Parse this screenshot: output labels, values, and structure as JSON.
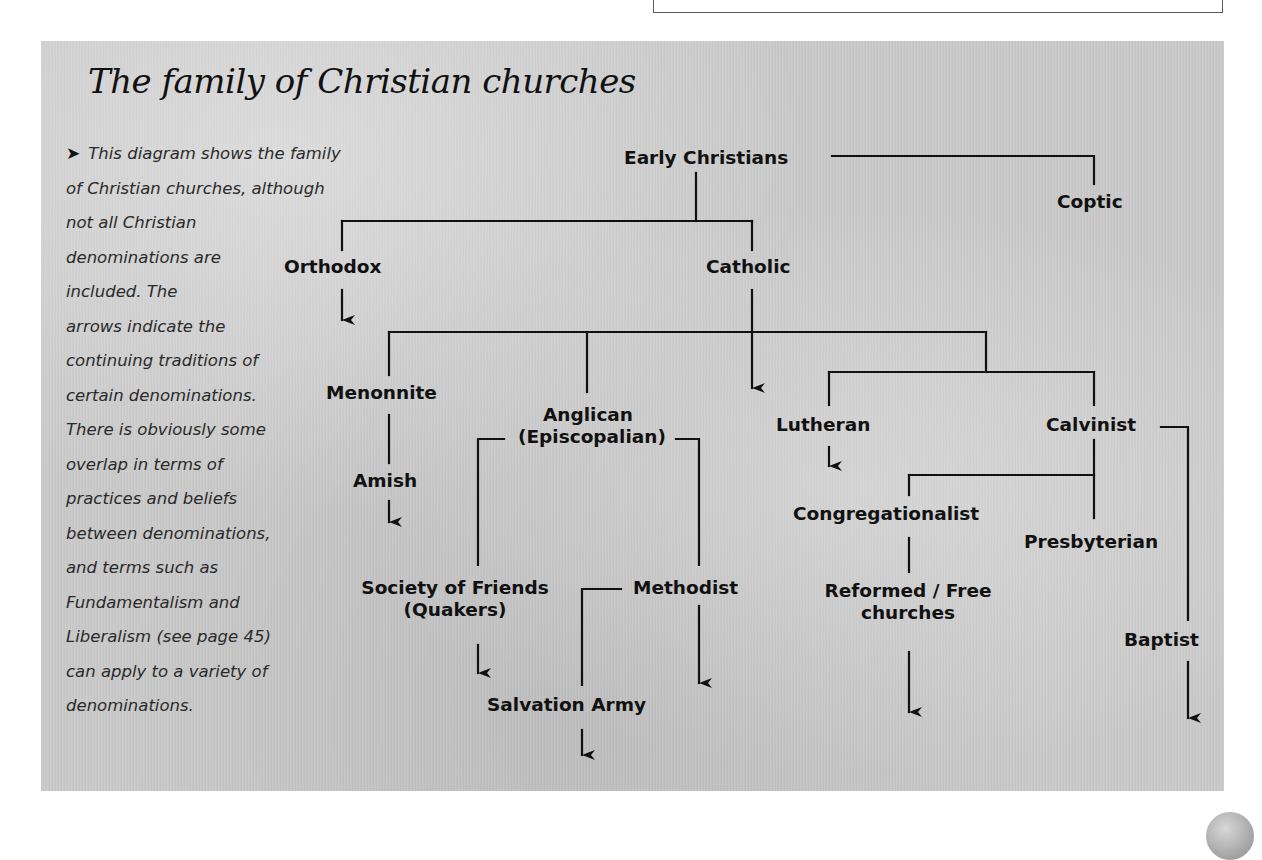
{
  "title": "The family of Christian churches",
  "description": {
    "bullet_icon": "➤",
    "lines": [
      "This diagram shows the family",
      "of Christian churches, although",
      "not all Christian",
      "denominations are",
      "included. The",
      "arrows indicate the",
      "continuing traditions of",
      "certain denominations.",
      "There is obviously some",
      "overlap in terms of",
      "practices and beliefs",
      "between denominations,",
      "and terms such as",
      "Fundamentalism and",
      "Liberalism (see page 45)",
      "can apply to a variety of",
      "denominations."
    ]
  },
  "nodes": {
    "early_christians": "Early Christians",
    "coptic": "Coptic",
    "orthodox": "Orthodox",
    "catholic": "Catholic",
    "menonnite": "Menonnite",
    "amish": "Amish",
    "anglican_line1": "Anglican",
    "anglican_line2": "(Episcopalian)",
    "lutheran": "Lutheran",
    "calvinist": "Calvinist",
    "congregationalist": "Congregationalist",
    "presbyterian": "Presbyterian",
    "society_line1": "Society of Friends",
    "society_line2": "(Quakers)",
    "methodist": "Methodist",
    "reformed_line1": "Reformed / Free",
    "reformed_line2": "churches",
    "baptist": "Baptist",
    "salvation_army": "Salvation Army"
  },
  "edges": [
    {
      "from": "Early Christians",
      "to": "Coptic"
    },
    {
      "from": "Early Christians",
      "to": "Orthodox"
    },
    {
      "from": "Early Christians",
      "to": "Catholic"
    },
    {
      "from": "Catholic",
      "to": "Menonnite"
    },
    {
      "from": "Catholic",
      "to": "Anglican (Episcopalian)"
    },
    {
      "from": "Catholic",
      "to": "Lutheran"
    },
    {
      "from": "Catholic",
      "to": "Calvinist"
    },
    {
      "from": "Menonnite",
      "to": "Amish"
    },
    {
      "from": "Anglican (Episcopalian)",
      "to": "Society of Friends (Quakers)"
    },
    {
      "from": "Anglican (Episcopalian)",
      "to": "Methodist"
    },
    {
      "from": "Methodist",
      "to": "Salvation Army"
    },
    {
      "from": "Calvinist",
      "to": "Congregationalist"
    },
    {
      "from": "Calvinist",
      "to": "Presbyterian"
    },
    {
      "from": "Calvinist",
      "to": "Baptist"
    },
    {
      "from": "Congregationalist",
      "to": "Reformed / Free churches"
    }
  ],
  "continuing_traditions": [
    "Orthodox",
    "Catholic",
    "Amish",
    "Lutheran",
    "Society of Friends (Quakers)",
    "Methodist",
    "Salvation Army",
    "Reformed / Free churches",
    "Baptist"
  ]
}
